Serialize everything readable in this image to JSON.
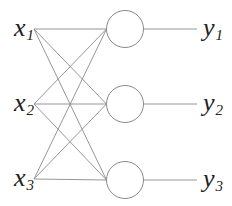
{
  "diagram": {
    "type": "neural-network-single-layer",
    "inputs": [
      {
        "base": "x",
        "sub": "1",
        "x": 34,
        "y": 29
      },
      {
        "base": "x",
        "sub": "2",
        "x": 34,
        "y": 104
      },
      {
        "base": "x",
        "sub": "3",
        "x": 34,
        "y": 179
      }
    ],
    "nodes": [
      {
        "cx": 125,
        "cy": 29,
        "r": 18.5
      },
      {
        "cx": 125,
        "cy": 104,
        "r": 18.5
      },
      {
        "cx": 125,
        "cy": 180,
        "r": 18.5
      }
    ],
    "outputs": [
      {
        "base": "y",
        "sub": "1",
        "x": 197,
        "y": 29
      },
      {
        "base": "y",
        "sub": "2",
        "x": 197,
        "y": 104
      },
      {
        "base": "y",
        "sub": "3",
        "x": 197,
        "y": 180
      }
    ],
    "colors": {
      "line": "#8a8a8a",
      "text": "#222222",
      "background": "#ffffff"
    }
  }
}
